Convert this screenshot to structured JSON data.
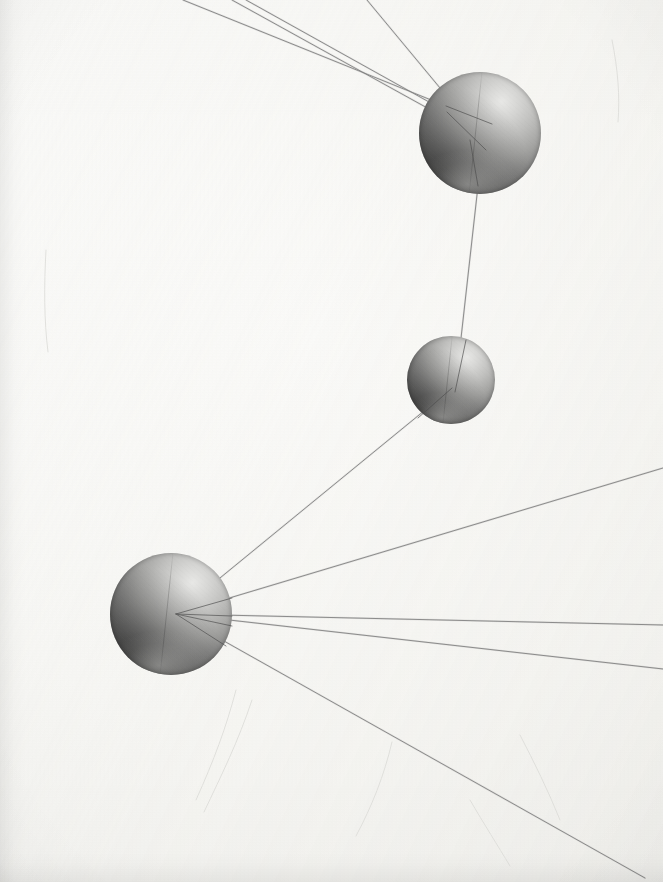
{
  "scene": {
    "title": "Three-node wire-and-sphere model photograph",
    "medium": "photographic print",
    "background_color": "#f8f8f6",
    "ink_color": "#6e6e6e",
    "canvas": {
      "width": 663,
      "height": 882
    }
  },
  "nodes": [
    {
      "id": "node-top",
      "label": "top-sphere",
      "cx": 480,
      "cy": 133,
      "r": 61,
      "highlight": "upper-right",
      "fill_light": "#e8e8e6",
      "fill_dark": "#3c3c3c"
    },
    {
      "id": "node-middle",
      "label": "middle-sphere",
      "cx": 451,
      "cy": 380,
      "r": 44,
      "highlight": "upper-right",
      "fill_light": "#e8e8e6",
      "fill_dark": "#3c3c3c"
    },
    {
      "id": "node-bottom-left",
      "label": "bottom-left-sphere",
      "cx": 171,
      "cy": 614,
      "r": 61,
      "highlight": "upper-right",
      "fill_light": "#e8e8e6",
      "fill_dark": "#3c3c3c"
    }
  ],
  "hubs": [
    {
      "id": "hub-top",
      "x": 446,
      "y": 106
    },
    {
      "id": "hub-middle",
      "x": 452,
      "y": 386
    },
    {
      "id": "hub-bottom",
      "x": 176,
      "y": 614
    }
  ],
  "edges": [
    {
      "id": "edge-top-out-1",
      "label": "top-node-wire-left",
      "x1": 446,
      "y1": 106,
      "x2": 183,
      "y2": 0
    },
    {
      "id": "edge-top-out-2",
      "label": "top-node-wire-center",
      "x1": 447,
      "y1": 112,
      "x2": 246,
      "y2": 0
    },
    {
      "id": "edge-top-out-3",
      "label": "top-node-wire-right",
      "x1": 450,
      "y1": 100,
      "x2": 367,
      "y2": 0
    },
    {
      "id": "edge-top-out-4",
      "label": "top-node-wire-left-lower",
      "x1": 449,
      "y1": 120,
      "x2": 232,
      "y2": 0
    },
    {
      "id": "edge-top-middle",
      "label": "top-to-middle-wire",
      "x1": 478,
      "y1": 186,
      "x2": 455,
      "y2": 392
    },
    {
      "id": "edge-middle-bottom",
      "label": "middle-to-bottom-wire",
      "x1": 452,
      "y1": 388,
      "x2": 176,
      "y2": 614
    },
    {
      "id": "edge-bottom-out-1",
      "label": "bottom-node-wire-upper-right",
      "x1": 176,
      "y1": 614,
      "x2": 663,
      "y2": 468
    },
    {
      "id": "edge-bottom-out-2",
      "label": "bottom-node-wire-right-upper",
      "x1": 176,
      "y1": 614,
      "x2": 663,
      "y2": 625
    },
    {
      "id": "edge-bottom-out-3",
      "label": "bottom-node-wire-right-lower",
      "x1": 176,
      "y1": 614,
      "x2": 663,
      "y2": 669
    },
    {
      "id": "edge-bottom-out-4",
      "label": "bottom-node-wire-lower-right",
      "x1": 176,
      "y1": 614,
      "x2": 645,
      "y2": 878
    }
  ],
  "surface_marks": [
    {
      "id": "scratch-1",
      "d": "M 236 690 C 226 728 214 760 196 800"
    },
    {
      "id": "scratch-2",
      "d": "M 252 700 C 238 742 222 774 204 812"
    },
    {
      "id": "scratch-3",
      "d": "M 520 735 C 534 762 548 790 560 820"
    },
    {
      "id": "scratch-4",
      "d": "M 612 40 C 618 70 620 96 618 122"
    },
    {
      "id": "scratch-5",
      "d": "M 46 250 C 44 286 44 320 48 352"
    },
    {
      "id": "scratch-6",
      "d": "M 392 742 C 384 776 372 806 356 836"
    },
    {
      "id": "scratch-7",
      "d": "M 470 800 C 484 824 498 846 510 866"
    }
  ],
  "annotations": {
    "alt_text": "Three gray spheres of differing sizes connected by fine wires on a pale paper background",
    "node_count": "3",
    "wire_count": "10"
  }
}
